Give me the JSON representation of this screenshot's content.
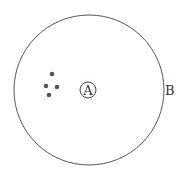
{
  "diagram": {
    "outer_circle": {
      "label": "B",
      "cx": 89,
      "cy": 90,
      "r": 75,
      "stroke": "#555555"
    },
    "center_marker": {
      "label": "A",
      "cx": 88,
      "cy": 90,
      "r": 8,
      "stroke": "#444444"
    },
    "dots": [
      {
        "cx": 52,
        "cy": 74
      },
      {
        "cx": 46,
        "cy": 86
      },
      {
        "cx": 57,
        "cy": 87
      },
      {
        "cx": 49,
        "cy": 95
      }
    ],
    "dot_color": "#555555"
  }
}
